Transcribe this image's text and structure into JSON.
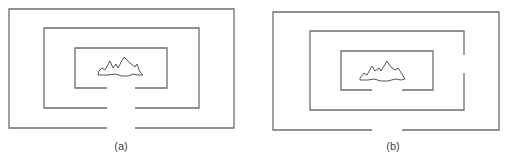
{
  "figure": {
    "colors": {
      "line": "#6e6e6e",
      "mountain": "#555555",
      "background": "#ffffff"
    },
    "panels": [
      {
        "id": "a",
        "caption": "(a)",
        "caption_pos": [
          121,
          140
        ],
        "openings_aligned": true,
        "walls": [
          {
            "name": "outer",
            "x1": 9,
            "y1": 9,
            "x2": 234,
            "y2": 128,
            "gap_side": "bottom",
            "gap_from": 107,
            "gap_to": 135
          },
          {
            "name": "middle",
            "x1": 44,
            "y1": 28,
            "x2": 199,
            "y2": 108,
            "gap_side": "bottom",
            "gap_from": 107,
            "gap_to": 135
          },
          {
            "name": "inner",
            "x1": 75,
            "y1": 48,
            "x2": 167,
            "y2": 88,
            "gap_side": "bottom",
            "gap_from": 107,
            "gap_to": 135
          }
        ],
        "mountain_points": "99,71 102,68 105,70 110,61 113,68 116,64 118,68 124,57 130,63 135,67 137,64 140,72 143,75 138,75 133,74 128,76 122,76 115,74 108,75 98,75"
      },
      {
        "id": "b",
        "caption": "(b)",
        "caption_pos": [
          393,
          140
        ],
        "openings_aligned": false,
        "walls": [
          {
            "name": "outer",
            "x1": 273,
            "y1": 12,
            "x2": 499,
            "y2": 130,
            "gap_side": "bottom",
            "gap_from": 372,
            "gap_to": 402
          },
          {
            "name": "middle",
            "x1": 310,
            "y1": 31,
            "x2": 464,
            "y2": 110,
            "gap_side": "right",
            "gap_from": 55,
            "gap_to": 73
          },
          {
            "name": "inner",
            "x1": 341,
            "y1": 51,
            "x2": 433,
            "y2": 90,
            "gap_side": "bottom",
            "gap_from": 372,
            "gap_to": 402
          }
        ],
        "mountain_points": "360,78 364,73 367,75 372,66 375,71 379,68 381,71 387,61 391,67 395,70 398,68 402,74 405,79 401,80 395,79 388,81 381,81 374,79 368,80 360,80"
      }
    ]
  }
}
